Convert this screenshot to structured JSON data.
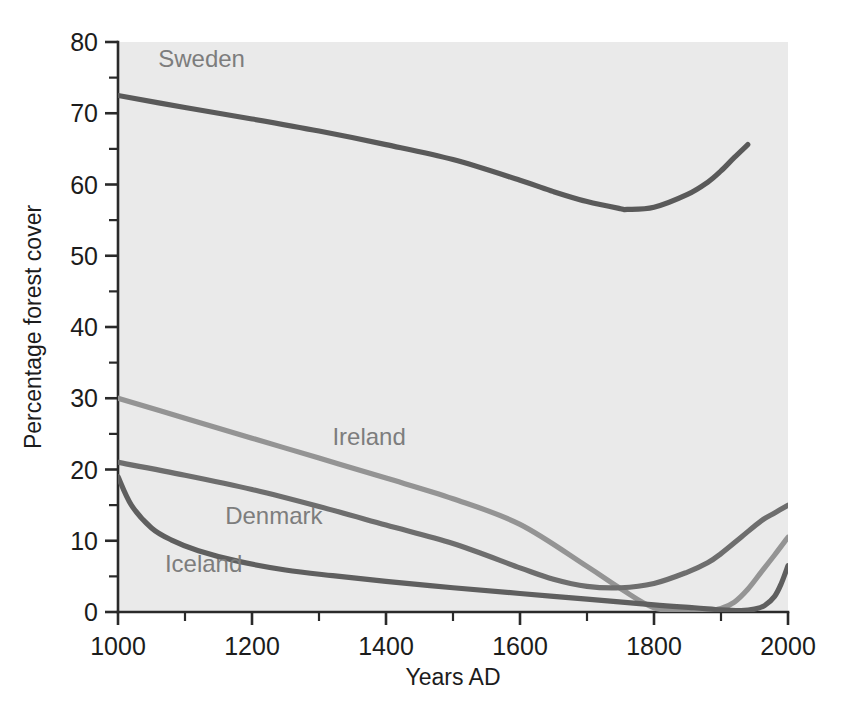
{
  "chart_data": {
    "type": "line",
    "title": "",
    "xlabel": "Years AD",
    "ylabel": "Percentage forest cover",
    "xlim": [
      1000,
      2000
    ],
    "ylim": [
      0,
      80
    ],
    "grid": false,
    "legend": "inline-labels",
    "background_color": "#eaeaea",
    "x_ticks": [
      1000,
      1200,
      1400,
      1600,
      1800,
      2000
    ],
    "x_tick_labels": [
      "1000",
      "1200",
      "1400",
      "1600",
      "1800",
      "2000"
    ],
    "x_minor_ticks": [
      1100,
      1300,
      1500,
      1700,
      1900
    ],
    "y_ticks": [
      0,
      10,
      20,
      30,
      40,
      50,
      60,
      70,
      80
    ],
    "y_tick_labels": [
      "0",
      "10",
      "20",
      "30",
      "40",
      "50",
      "60",
      "70",
      "80"
    ],
    "y_minor_ticks": [
      5,
      15,
      25,
      35,
      45,
      55,
      65,
      75
    ],
    "series": [
      {
        "name": "Sweden",
        "color": "#5a5a5a",
        "stroke_width": 5.2,
        "label_x": 1060,
        "label_y": 76.5,
        "x": [
          1000,
          1100,
          1200,
          1300,
          1400,
          1500,
          1600,
          1650,
          1700,
          1750,
          1760,
          1800,
          1850,
          1880,
          1900,
          1920,
          1940
        ],
        "y": [
          72.5,
          70.8,
          69.2,
          67.5,
          65.6,
          63.5,
          60.6,
          59.0,
          57.6,
          56.6,
          56.5,
          56.8,
          58.6,
          60.3,
          61.9,
          63.8,
          65.6
        ]
      },
      {
        "name": "Ireland",
        "color": "#949494",
        "stroke_width": 5.2,
        "label_x": 1320,
        "label_y": 23.4,
        "x": [
          1000,
          1100,
          1200,
          1300,
          1400,
          1500,
          1600,
          1700,
          1750,
          1800,
          1850,
          1880,
          1900,
          1920,
          1940,
          1960,
          1980,
          2000
        ],
        "y": [
          30.0,
          27.2,
          24.4,
          21.6,
          18.8,
          15.9,
          12.3,
          6.4,
          3.3,
          0.6,
          0.1,
          0.2,
          0.5,
          1.4,
          3.2,
          5.6,
          8.0,
          10.5
        ]
      },
      {
        "name": "Denmark",
        "color": "#6e6e6e",
        "stroke_width": 5.2,
        "label_x": 1160,
        "label_y": 12.3,
        "x": [
          1000,
          1100,
          1200,
          1300,
          1400,
          1500,
          1600,
          1650,
          1700,
          1750,
          1800,
          1850,
          1880,
          1900,
          1930,
          1960,
          1980,
          2000
        ],
        "y": [
          21.0,
          19.2,
          17.2,
          14.8,
          12.2,
          9.6,
          6.2,
          4.6,
          3.6,
          3.4,
          4.0,
          5.6,
          6.9,
          8.2,
          10.5,
          12.8,
          13.9,
          15.0
        ]
      },
      {
        "name": "Iceland",
        "color": "#5f5f5f",
        "stroke_width": 5.2,
        "label_x": 1070,
        "label_y": 5.6,
        "x": [
          1000,
          1020,
          1050,
          1080,
          1120,
          1180,
          1250,
          1320,
          1400,
          1500,
          1600,
          1700,
          1800,
          1860,
          1900,
          1930,
          1950,
          1965,
          1980,
          1990,
          2000
        ],
        "y": [
          19.0,
          15.0,
          11.8,
          10.1,
          8.6,
          7.1,
          5.9,
          5.1,
          4.3,
          3.4,
          2.6,
          1.8,
          1.0,
          0.6,
          0.3,
          0.2,
          0.4,
          0.9,
          2.2,
          4.0,
          6.5
        ]
      }
    ]
  },
  "axes": {
    "x_title": "Years AD",
    "y_title": "Percentage forest cover"
  }
}
